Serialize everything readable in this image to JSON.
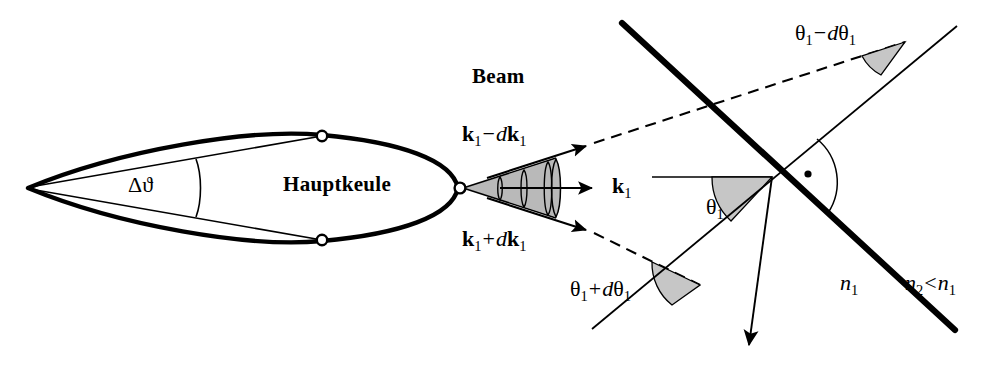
{
  "figure": {
    "background_color": "#ffffff",
    "stroke_color": "#000000",
    "cone_fill_color": "#b8b8b8",
    "wedge_fill_color": "#c6c6c6",
    "width": 994,
    "height": 372
  },
  "labels": {
    "delta_theta": {
      "delta": "Δ",
      "theta": "ϑ",
      "full": "Δϑ"
    },
    "main_lobe": "Hauptkeule",
    "beam": "Beam",
    "k_minus": {
      "k": "k",
      "sub1": "1",
      "minus": "−",
      "d": "d",
      "k2": "k",
      "sub2": "1",
      "full": "k₁ − d k₁"
    },
    "k_center": {
      "k": "k",
      "sub1": "1",
      "full": "k₁"
    },
    "k_plus": {
      "k": "k",
      "sub1": "1",
      "plus": "+",
      "d": "d",
      "k2": "k",
      "sub2": "1",
      "full": "k₁ + d k₁"
    },
    "theta_minus": {
      "theta": "θ",
      "sub1": "1",
      "minus": "−",
      "d": "d",
      "theta2": "θ",
      "sub2": "1",
      "full": "θ₁ − dθ₁"
    },
    "theta_center": {
      "theta": "θ",
      "sub1": "1",
      "full": "θ₁"
    },
    "theta_plus": {
      "theta": "θ",
      "sub1": "1",
      "plus": "+",
      "d": "d",
      "theta2": "θ",
      "sub2": "1",
      "full": "θ₁ + dθ₁"
    },
    "n1": {
      "n": "n",
      "sub1": "1",
      "full": "n₁"
    },
    "n2_lt_n1": {
      "n": "n",
      "sub2": "2",
      "lt": "<",
      "n_b": "n",
      "sub1": "1",
      "full": "n₂ < n₁"
    }
  },
  "geometry": {
    "lobe_apex": [
      28,
      188
    ],
    "lobe_tip": [
      458,
      188
    ],
    "lobe_upper_node": [
      322,
      136
    ],
    "lobe_lower_node": [
      322,
      240
    ],
    "cone_apex": [
      462,
      188
    ],
    "cone_half_angle_deg": 15,
    "wavefront_count": 3,
    "interface_start": [
      622,
      23
    ],
    "interface_end": [
      955,
      330
    ],
    "normal_start": [
      592,
      329
    ],
    "normal_end": [
      957,
      26
    ],
    "intersection": [
      772,
      176
    ],
    "refracted_arrow_end": [
      748,
      352
    ],
    "incident_center_start": [
      487,
      188
    ],
    "dashed_upper_start": [
      497,
      152
    ],
    "dashed_lower_start": [
      497,
      226
    ]
  },
  "annotations": {
    "right_angle_marker": "·",
    "right_angle_value": "90°"
  }
}
